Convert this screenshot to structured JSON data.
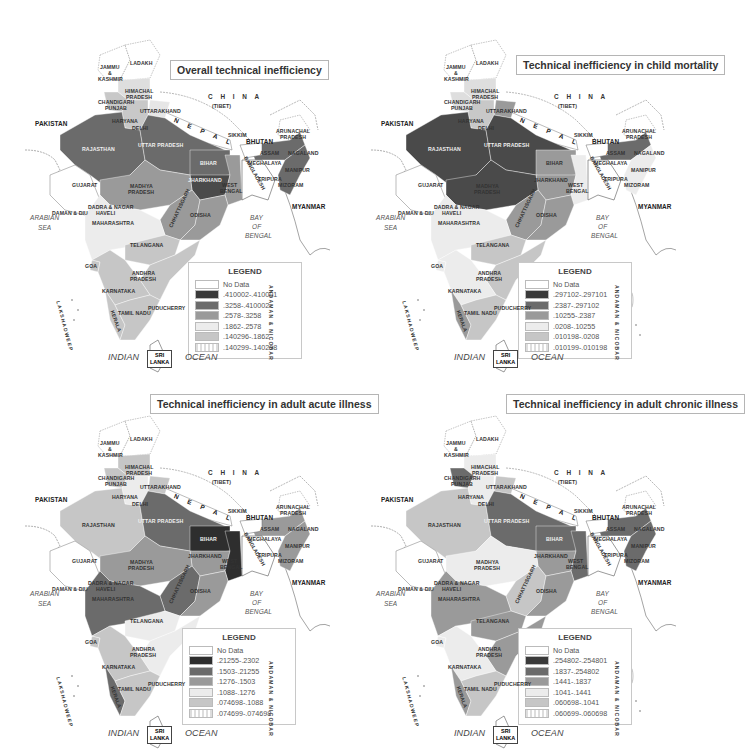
{
  "figure": {
    "panels": [
      {
        "id": "overall",
        "title": "Overall technical inefficiency",
        "legend": {
          "heading": "LEGEND",
          "items": [
            {
              "label": "No Data",
              "color": "#ffffff"
            },
            {
              "label": ".410002-.410001",
              "color": "#3a3a3a"
            },
            {
              "label": ".3258-.410002",
              "color": "#6b6b6b"
            },
            {
              "label": ".2578-.3258",
              "color": "#9a9a9a"
            },
            {
              "label": ".1862-.2578",
              "color": "#ececec"
            },
            {
              "label": ".140296-.1862",
              "color": "#c6c6c6"
            },
            {
              "label": ".140299-.140298",
              "color": "#e4e4e4",
              "pattern": "hatch"
            }
          ]
        },
        "region_shades": {
          "ladakh": "#ffffff",
          "jk": "#ffffff",
          "himachal": "#dedede",
          "punjab": "#c8c8c8",
          "uttarakhand": "#e6e6e6",
          "haryana": "#c8c8c8",
          "rajasthan": "#6b6b6b",
          "up": "#6b6b6b",
          "bihar": "#6b6b6b",
          "jharkhand": "#4a4a4a",
          "westbengal": "#9a9a9a",
          "gujarat": "#ffffff",
          "mp": "#9a9a9a",
          "chhattisgarh": "#9a9a9a",
          "odisha": "#9a9a9a",
          "maharashtra": "#ececec",
          "telangana": "#c6c6c6",
          "andhra": "#c6c6c6",
          "karnataka": "#c6c6c6",
          "tamilnadu": "#c6c6c6",
          "kerala": "#c6c6c6",
          "goa": "#c6c6c6",
          "northeast": "#6b6b6b",
          "assam": "#6b6b6b"
        }
      },
      {
        "id": "child-mortality",
        "title": "Technical inefficiency in child mortality",
        "legend": {
          "heading": "LEGEND",
          "items": [
            {
              "label": "No Data",
              "color": "#ffffff"
            },
            {
              "label": ".297102-.297101",
              "color": "#3a3a3a"
            },
            {
              "label": ".2387-.297102",
              "color": "#6b6b6b"
            },
            {
              "label": ".10255-.2387",
              "color": "#9a9a9a"
            },
            {
              "label": ".0208-.10255",
              "color": "#ececec"
            },
            {
              "label": ".010198-.0208",
              "color": "#c6c6c6"
            },
            {
              "label": ".010199-.010198",
              "color": "#e4e4e4",
              "pattern": "hatch"
            }
          ]
        },
        "region_shades": {
          "ladakh": "#ffffff",
          "jk": "#ffffff",
          "himachal": "#dedede",
          "punjab": "#dedede",
          "uttarakhand": "#9a9a9a",
          "haryana": "#c8c8c8",
          "rajasthan": "#4a4a4a",
          "up": "#4a4a4a",
          "bihar": "#9a9a9a",
          "jharkhand": "#9a9a9a",
          "westbengal": "#ececec",
          "gujarat": "#ffffff",
          "mp": "#4a4a4a",
          "chhattisgarh": "#9a9a9a",
          "odisha": "#9a9a9a",
          "maharashtra": "#ececec",
          "telangana": "#c6c6c6",
          "andhra": "#c6c6c6",
          "karnataka": "#ececec",
          "tamilnadu": "#c6c6c6",
          "kerala": "#9a9a9a",
          "goa": "#ececec",
          "northeast": "#ececec",
          "assam": "#6b6b6b"
        }
      },
      {
        "id": "adult-acute",
        "title": "Technical inefficiency in adult acute illness",
        "legend": {
          "heading": "LEGEND",
          "items": [
            {
              "label": "No Data",
              "color": "#ffffff"
            },
            {
              "label": ".21255-.2302",
              "color": "#2e2e2e"
            },
            {
              "label": ".1503-.21255",
              "color": "#6b6b6b"
            },
            {
              "label": ".1276-.1503",
              "color": "#9a9a9a"
            },
            {
              "label": ".1088-.1276",
              "color": "#ececec"
            },
            {
              "label": ".074698-.1088",
              "color": "#c6c6c6"
            },
            {
              "label": ".074699-.074698",
              "color": "#e4e4e4",
              "pattern": "hatch"
            }
          ]
        },
        "region_shades": {
          "ladakh": "#ffffff",
          "jk": "#ffffff",
          "himachal": "#c6c6c6",
          "punjab": "#c6c6c6",
          "uttarakhand": "#c6c6c6",
          "haryana": "#ececec",
          "rajasthan": "#c6c6c6",
          "up": "#6b6b6b",
          "bihar": "#2e2e2e",
          "jharkhand": "#9a9a9a",
          "westbengal": "#2e2e2e",
          "gujarat": "#ffffff",
          "mp": "#9a9a9a",
          "chhattisgarh": "#6b6b6b",
          "odisha": "#9a9a9a",
          "maharashtra": "#6b6b6b",
          "telangana": "#ececec",
          "andhra": "#ececec",
          "karnataka": "#c6c6c6",
          "tamilnadu": "#c6c6c6",
          "kerala": "#6b6b6b",
          "goa": "#c6c6c6",
          "northeast": "#9a9a9a",
          "assam": "#9a9a9a"
        }
      },
      {
        "id": "adult-chronic",
        "title": "Technical inefficiency in adult chronic illness",
        "legend": {
          "heading": "LEGEND",
          "items": [
            {
              "label": "No Data",
              "color": "#ffffff"
            },
            {
              "label": ".254802-.254801",
              "color": "#3a3a3a"
            },
            {
              "label": ".1837-.254802",
              "color": "#6b6b6b"
            },
            {
              "label": ".1441-.1837",
              "color": "#9a9a9a"
            },
            {
              "label": ".1041-.1441",
              "color": "#ececec"
            },
            {
              "label": ".060698-.1041",
              "color": "#c6c6c6"
            },
            {
              "label": ".060699-.060698",
              "color": "#e4e4e4",
              "pattern": "hatch"
            }
          ]
        },
        "region_shades": {
          "ladakh": "#ffffff",
          "jk": "#ffffff",
          "himachal": "#ececec",
          "punjab": "#6b6b6b",
          "uttarakhand": "#c6c6c6",
          "haryana": "#ececec",
          "rajasthan": "#c6c6c6",
          "up": "#6b6b6b",
          "bihar": "#6b6b6b",
          "jharkhand": "#9a9a9a",
          "westbengal": "#6b6b6b",
          "gujarat": "#ffffff",
          "mp": "#ececec",
          "chhattisgarh": "#c6c6c6",
          "odisha": "#9a9a9a",
          "maharashtra": "#9a9a9a",
          "telangana": "#9a9a9a",
          "andhra": "#9a9a9a",
          "karnataka": "#ececec",
          "tamilnadu": "#c6c6c6",
          "kerala": "#9a9a9a",
          "goa": "#ececec",
          "northeast": "#6b6b6b",
          "assam": "#6b6b6b"
        }
      }
    ],
    "labels": {
      "ladakh": "LADAKH",
      "jk": [
        "JAMMU",
        "&",
        "KASHMIR"
      ],
      "himachal": [
        "HIMACHAL",
        "PRADESH"
      ],
      "chandigarh": "CHANDIGARH",
      "punjab": "PUNJAB",
      "uttarakhand": "UTTARAKHAND",
      "haryana": "HARYANA",
      "delhi": "DELHI",
      "rajasthan": "RAJASTHAN",
      "up": "UTTAR PRADESH",
      "bihar": "BIHAR",
      "jharkhand": "JHARKHAND",
      "westbengal": [
        "WEST",
        "BENGAL"
      ],
      "gujarat": "GUJARAT",
      "mp": [
        "MADHYA",
        "PRADESH"
      ],
      "chhattisgarh": "CHHATTISGARH",
      "odisha": "ODISHA",
      "dadra": [
        "DADRA & NAGAR",
        "HAVELI"
      ],
      "daman": "DAMAN & DIU",
      "maharashtra": "MAHARASHTRA",
      "telangana": "TELANGANA",
      "goa": "GOA",
      "andhra": [
        "ANDHRA",
        "PRADESH"
      ],
      "karnataka": "KARNATAKA",
      "puducherry": "PUDUCHERRY",
      "tamilnadu": "TAMIL NADU",
      "kerala": "KERALA",
      "sikkim": "SIKKIM",
      "bhutan": "BHUTAN",
      "arunachal": [
        "ARUNACHAL",
        "PRADESH"
      ],
      "assam": "ASSAM",
      "nagaland": "NAGALAND",
      "meghalaya": "MEGHALAYA",
      "manipur": "MANIPUR",
      "tripura": "TRIPURA",
      "mizoram": "MIZORAM",
      "bangladesh": "BANGLADESH",
      "nepal": "N E P A L",
      "china": "C H I N A",
      "tibet": "(TIBET)",
      "pakistan": "PAKISTAN",
      "myanmar": "MYANMAR",
      "arabian_sea": [
        "ARABIAN",
        "SEA"
      ],
      "bay_of_bengal": [
        "BAY",
        "OF",
        "BENGAL"
      ],
      "indian": "INDIAN",
      "ocean": "OCEAN",
      "sri_lanka": [
        "SRI",
        "LANKA"
      ],
      "lakshadweep": "LAKSHADWEEP",
      "andaman": "ANDAMAN & NICOBAR"
    }
  }
}
